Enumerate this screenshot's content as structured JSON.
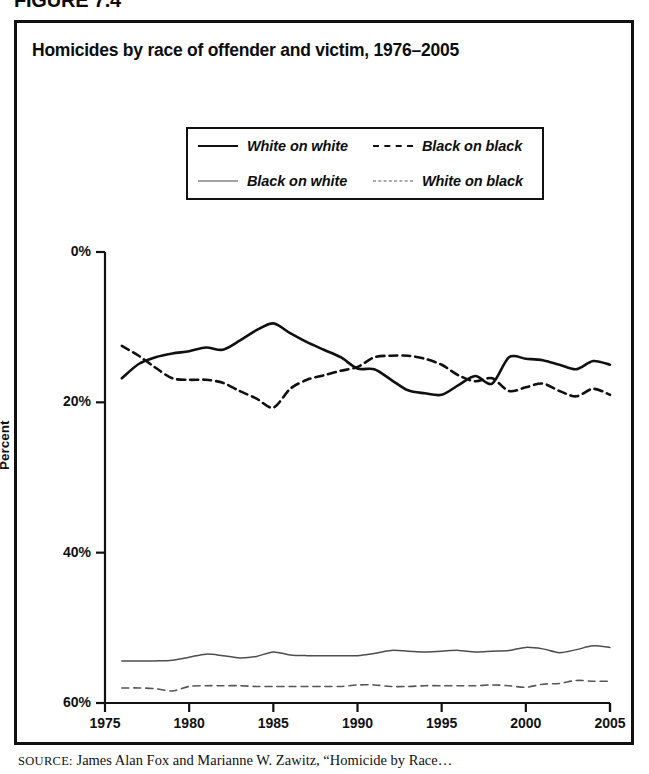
{
  "figure": {
    "label": "FIGURE 7.4",
    "title": "Homicides by race of offender and victim, 1976–2005",
    "source_prefix": "SOURCE:",
    "source_text": "James Alan Fox and Marianne W. Zawitz, “Homicide by Race…"
  },
  "axes": {
    "y_title": "Percent",
    "y_ticks": [
      "60%",
      "40%",
      "20%",
      "0%"
    ],
    "x_ticks": [
      "1975",
      "1980",
      "1985",
      "1990",
      "1995",
      "2000",
      "2005"
    ]
  },
  "legend": {
    "items": [
      {
        "label": "White on white",
        "style": "solid-thick",
        "color": "#101010"
      },
      {
        "label": "Black on black",
        "style": "dash-thick",
        "color": "#101010"
      },
      {
        "label": "Black on white",
        "style": "solid-thin",
        "color": "#4d4d4d"
      },
      {
        "label": "White on black",
        "style": "dash-thin",
        "color": "#565656"
      }
    ]
  },
  "chart_data": {
    "type": "line",
    "title": "Homicides by race of offender and victim, 1976–2005",
    "xlabel": "",
    "ylabel": "Percent",
    "xlim": [
      1975,
      2005
    ],
    "ylim": [
      0,
      60
    ],
    "y_ticks": [
      0,
      20,
      40,
      60
    ],
    "x_ticks": [
      1975,
      1980,
      1985,
      1990,
      1995,
      2000,
      2005
    ],
    "grid": false,
    "legend_position": "upper-center",
    "x": [
      1976,
      1977,
      1978,
      1979,
      1980,
      1981,
      1982,
      1983,
      1984,
      1985,
      1986,
      1987,
      1988,
      1989,
      1990,
      1991,
      1992,
      1993,
      1994,
      1995,
      1996,
      1997,
      1998,
      1999,
      2000,
      2001,
      2002,
      2003,
      2004,
      2005
    ],
    "series": [
      {
        "name": "White on white",
        "style": "solid-thick",
        "color": "#101010",
        "values": [
          43.2,
          45.1,
          46.0,
          46.5,
          46.8,
          47.3,
          47.0,
          48.2,
          49.6,
          50.5,
          49.2,
          48.0,
          47.0,
          46.0,
          44.5,
          44.4,
          43.0,
          41.6,
          41.2,
          41.0,
          42.3,
          43.5,
          42.5,
          46.0,
          45.8,
          45.6,
          45.0,
          44.4,
          45.5,
          45.0
        ]
      },
      {
        "name": "Black on black",
        "style": "dash-thick",
        "color": "#101010",
        "values": [
          47.5,
          46.2,
          44.6,
          43.2,
          43.0,
          43.0,
          42.6,
          41.5,
          40.5,
          39.3,
          41.8,
          43.0,
          43.6,
          44.2,
          44.7,
          46.0,
          46.2,
          46.2,
          45.8,
          45.0,
          43.6,
          42.8,
          43.2,
          41.5,
          42.0,
          42.5,
          41.5,
          40.8,
          41.8,
          41.0
        ]
      },
      {
        "name": "Black on white",
        "style": "solid-thin",
        "color": "#4d4d4d",
        "values": [
          5.6,
          5.6,
          5.6,
          5.7,
          6.1,
          6.5,
          6.3,
          6.0,
          6.2,
          6.8,
          6.4,
          6.3,
          6.3,
          6.3,
          6.3,
          6.6,
          7.0,
          6.9,
          6.8,
          6.9,
          7.0,
          6.8,
          6.9,
          7.0,
          7.4,
          7.2,
          6.7,
          7.1,
          7.6,
          7.4
        ]
      },
      {
        "name": "White on black",
        "style": "dash-thin",
        "color": "#565656",
        "values": [
          2.0,
          2.0,
          1.9,
          1.6,
          2.2,
          2.3,
          2.3,
          2.3,
          2.2,
          2.2,
          2.2,
          2.2,
          2.2,
          2.2,
          2.4,
          2.4,
          2.2,
          2.2,
          2.3,
          2.3,
          2.3,
          2.3,
          2.4,
          2.3,
          2.1,
          2.5,
          2.6,
          3.0,
          2.9,
          2.9
        ]
      }
    ]
  }
}
